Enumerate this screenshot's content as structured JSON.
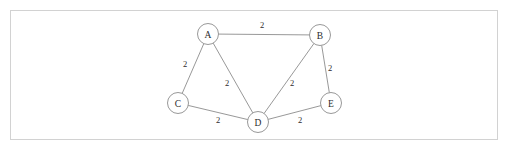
{
  "figure": {
    "frame": {
      "x": 10,
      "y": 10,
      "width": 488,
      "height": 130,
      "border_color": "#d2d2d2",
      "background_color": "#ffffff"
    },
    "stroke_color": "#8c8c8c",
    "text_color": "#2b2b2b"
  },
  "chart_data": {
    "type": "diagram",
    "subtype": "undirected-weighted-graph",
    "title": "",
    "xlabel": "",
    "ylabel": "",
    "grid": false,
    "legend": false,
    "node_radius": 10.5,
    "nodes": [
      {
        "id": "A",
        "label": "A",
        "x": 208,
        "y": 34
      },
      {
        "id": "B",
        "label": "B",
        "x": 320,
        "y": 35
      },
      {
        "id": "C",
        "label": "C",
        "x": 178,
        "y": 103
      },
      {
        "id": "D",
        "label": "D",
        "x": 258,
        "y": 122
      },
      {
        "id": "E",
        "label": "E",
        "x": 331,
        "y": 103
      }
    ],
    "edges": [
      {
        "source": "A",
        "target": "B",
        "weight": "2",
        "label_x": 262,
        "label_y": 25
      },
      {
        "source": "A",
        "target": "C",
        "weight": "2",
        "label_x": 185,
        "label_y": 64
      },
      {
        "source": "A",
        "target": "D",
        "weight": "2",
        "label_x": 227,
        "label_y": 83
      },
      {
        "source": "B",
        "target": "D",
        "weight": "2",
        "label_x": 292,
        "label_y": 83
      },
      {
        "source": "B",
        "target": "E",
        "weight": "2",
        "label_x": 330,
        "label_y": 68
      },
      {
        "source": "C",
        "target": "D",
        "weight": "2",
        "label_x": 218,
        "label_y": 120
      },
      {
        "source": "D",
        "target": "E",
        "weight": "2",
        "label_x": 300,
        "label_y": 120
      }
    ]
  }
}
